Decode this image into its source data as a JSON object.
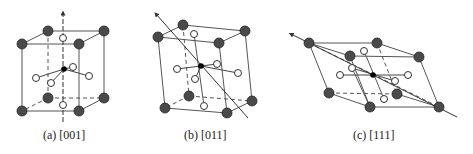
{
  "figure": {
    "panels": [
      {
        "id": "a",
        "caption": "(a) [001]",
        "direction": "[001]"
      },
      {
        "id": "b",
        "caption": "(b) [011]",
        "direction": "[011]"
      },
      {
        "id": "c",
        "caption": "(c) [111]",
        "direction": "[111]"
      }
    ],
    "colors": {
      "edge": "#555555",
      "dark_atom": "#4a4a4a",
      "open_atom_fill": "#ffffff",
      "center_atom": "#000000",
      "axis": "#333333"
    }
  }
}
